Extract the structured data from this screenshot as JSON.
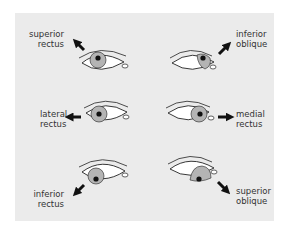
{
  "figure": {
    "background": "#ebebeb",
    "colors": {
      "iris": "#b4b4b4",
      "pupil": "#111111",
      "outline": "#222222",
      "arrow": "#111111",
      "sclera": "#ffffff"
    },
    "muscles": [
      {
        "id": "superior-rectus",
        "line1": "superior",
        "line2": "rectus",
        "direction": "up-left",
        "position": "top-left"
      },
      {
        "id": "inferior-oblique",
        "line1": "inferior",
        "line2": "oblique",
        "direction": "up-right",
        "position": "top-right"
      },
      {
        "id": "lateral-rectus",
        "line1": "lateral",
        "line2": "rectus",
        "direction": "left",
        "position": "middle-left"
      },
      {
        "id": "medial-rectus",
        "line1": "medial",
        "line2": "rectus",
        "direction": "right",
        "position": "middle-right"
      },
      {
        "id": "inferior-rectus",
        "line1": "inferior",
        "line2": "rectus",
        "direction": "down-left",
        "position": "bottom-left"
      },
      {
        "id": "superior-oblique",
        "line1": "superior",
        "line2": "oblique",
        "direction": "down-right",
        "position": "bottom-right"
      }
    ]
  }
}
